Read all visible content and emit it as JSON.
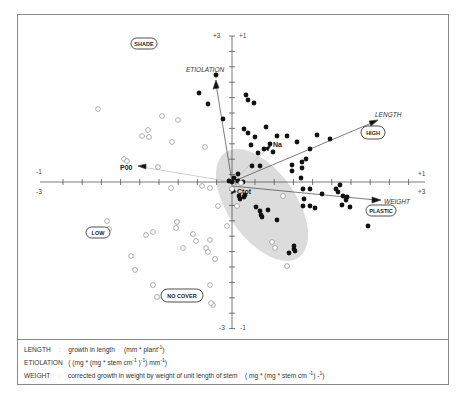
{
  "chart_data": {
    "type": "scatter",
    "title": "",
    "axes": {
      "x": {
        "label_left_outer": "-3",
        "label_left_inner": "-1",
        "label_right_outer": "+3",
        "label_right_inner": "+1",
        "range_outer": [
          -3,
          3
        ],
        "range_inner": [
          -1,
          1
        ]
      },
      "y": {
        "label_top_outer": "+3",
        "label_top_inner": "+1",
        "label_bottom_outer": "-3",
        "label_bottom_inner": "-1",
        "range_outer": [
          -3,
          3
        ],
        "range_inner": [
          -1,
          1
        ]
      }
    },
    "vectors": [
      {
        "name": "ETIOLATION",
        "x_end_px": 216,
        "y_end_px": 82,
        "italic": true
      },
      {
        "name": "LENGTH",
        "x_end_px": 376,
        "y_end_px": 121,
        "italic": true
      },
      {
        "name": "WEIGHT",
        "x_end_px": 379,
        "y_end_px": 200,
        "italic": true
      },
      {
        "name": "P00",
        "x_end_px": 141,
        "y_end_px": 167,
        "italic": false,
        "supplementary": true
      },
      {
        "name": "Na",
        "x_end_px": 268,
        "y_end_px": 148,
        "italic": false,
        "supplementary": true
      },
      {
        "name": "Ctot",
        "x_end_px": 233,
        "y_end_px": 190,
        "italic": false,
        "supplementary": true
      }
    ],
    "region_labels": [
      "SHADE",
      "HIGH",
      "LOW",
      "PLASTIC",
      "NO COVER"
    ],
    "series": [
      {
        "name": "filled",
        "points_px": [
          [
            216,
            75
          ],
          [
            199,
            93
          ],
          [
            208,
            104
          ],
          [
            223,
            119
          ],
          [
            246,
            95
          ],
          [
            248,
            100
          ],
          [
            254,
            103
          ],
          [
            244,
            129
          ],
          [
            248,
            133
          ],
          [
            255,
            137
          ],
          [
            251,
            145
          ],
          [
            266,
            127
          ],
          [
            277,
            136
          ],
          [
            264,
            149
          ],
          [
            270,
            144
          ],
          [
            287,
            136
          ],
          [
            297,
            142
          ],
          [
            317,
            135
          ],
          [
            330,
            139
          ],
          [
            310,
            149
          ],
          [
            260,
            166
          ],
          [
            238,
            174
          ],
          [
            252,
            166
          ],
          [
            292,
            165
          ],
          [
            292,
            171
          ],
          [
            302,
            162
          ],
          [
            302,
            168
          ],
          [
            301,
            178
          ],
          [
            273,
            152
          ],
          [
            258,
            153
          ],
          [
            306,
            159
          ],
          [
            243,
            182
          ],
          [
            238,
            181
          ],
          [
            232,
            182
          ],
          [
            234,
            178
          ],
          [
            229,
            181
          ],
          [
            336,
            189
          ],
          [
            338,
            192
          ],
          [
            347,
            197
          ],
          [
            346,
            200
          ],
          [
            368,
            226
          ],
          [
            342,
            205
          ],
          [
            350,
            207
          ],
          [
            343,
            196
          ],
          [
            310,
            189
          ],
          [
            322,
            194
          ],
          [
            340,
            185
          ],
          [
            303,
            189
          ],
          [
            304,
            199
          ],
          [
            303,
            206
          ],
          [
            310,
            206
          ],
          [
            315,
            208
          ],
          [
            262,
            217
          ],
          [
            261,
            215
          ],
          [
            268,
            210
          ],
          [
            245,
            195
          ],
          [
            244,
            197
          ],
          [
            256,
            207
          ],
          [
            260,
            211
          ],
          [
            277,
            220
          ],
          [
            294,
            249
          ],
          [
            294,
            246
          ],
          [
            295,
            251
          ],
          [
            289,
            253
          ],
          [
            240,
            199
          ],
          [
            239,
            196
          ]
        ]
      },
      {
        "name": "open",
        "points_px": [
          [
            98,
            109
          ],
          [
            162,
            116
          ],
          [
            178,
            120
          ],
          [
            148,
            130
          ],
          [
            142,
            136
          ],
          [
            149,
            137
          ],
          [
            172,
            142
          ],
          [
            205,
            147
          ],
          [
            124,
            159
          ],
          [
            127,
            161
          ],
          [
            158,
            167
          ],
          [
            171,
            188
          ],
          [
            202,
            186
          ],
          [
            210,
            188
          ],
          [
            241,
            183
          ],
          [
            232,
            189
          ],
          [
            283,
            196
          ],
          [
            237,
            206
          ],
          [
            227,
            226
          ],
          [
            272,
            242
          ],
          [
            275,
            248
          ],
          [
            287,
            266
          ],
          [
            107,
            221
          ],
          [
            109,
            229
          ],
          [
            146,
            235
          ],
          [
            153,
            232
          ],
          [
            177,
            222
          ],
          [
            176,
            228
          ],
          [
            193,
            234
          ],
          [
            196,
            241
          ],
          [
            183,
            248
          ],
          [
            210,
            240
          ],
          [
            206,
            248
          ],
          [
            208,
            252
          ],
          [
            215,
            259
          ],
          [
            131,
            256
          ],
          [
            135,
            270
          ],
          [
            153,
            285
          ],
          [
            157,
            297
          ],
          [
            210,
            285
          ],
          [
            213,
            305
          ],
          [
            211,
            303
          ],
          [
            218,
            206
          ]
        ]
      }
    ],
    "legend": [
      {
        "key": "LENGTH",
        "text": "growth in length (mm * plant-1)"
      },
      {
        "key": "ETIOLATION",
        "text": "((mg * (mg * stem cm-1)-1) mm-1)"
      },
      {
        "key": "WEIGHT",
        "text": "corrected growth in weight by weight of unit length of stem (mg * (mg * stem cm-1) -1)"
      }
    ]
  },
  "labels": {
    "shade": "SHADE",
    "high": "HIGH",
    "low": "LOW",
    "plastic": "PLASTIC",
    "no_cover": "NO COVER",
    "etiolation": "ETIOLATION",
    "length": "LENGTH",
    "weight": "WEIGHT",
    "p00": "P00",
    "na": "Na",
    "ctot": "Ctot"
  },
  "ticks": {
    "top_outer": "+3",
    "top_inner": "+1",
    "bottom_outer": "-3",
    "bottom_inner": "-1",
    "left_inner": "-1",
    "left_outer": "-3",
    "right_inner": "+1",
    "right_outer": "+3"
  },
  "legend": {
    "line1_key": "LENGTH",
    "line1_sep": ":",
    "line1_text": "growth in length",
    "line1_unit_pre": "(mm * plant",
    "line1_unit_sup": "-1",
    "line1_unit_post": ")",
    "line2_key": "ETIOLATION",
    "line2_text_a": "( (mg * (mg * stem cm",
    "line2_sup_a": "-1",
    "line2_text_b": " )",
    "line2_sup_b": "-1",
    "line2_text_c": ") mm",
    "line2_sup_c": "-1",
    "line2_text_d": ")",
    "line3_key": "WEIGHT",
    "line3_sep": ":",
    "line3_text": "corrected growth in weight by weight of unit length of stem",
    "line3_unit_a": "( mg * (mg * stem cm ",
    "line3_sup_a": "-1",
    "line3_unit_b": ") -",
    "line3_sup_b": "1",
    "line3_unit_c": ")"
  }
}
